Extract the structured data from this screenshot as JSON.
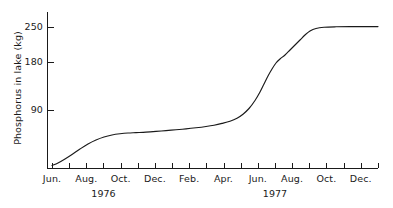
{
  "chart_data": {
    "type": "line",
    "title": "",
    "xlabel": "",
    "ylabel": "Phosphorus in lake (kg)",
    "grid": false,
    "legend": "none",
    "ylim": [
      0,
      268
    ],
    "yticks": [
      90,
      180,
      250
    ],
    "ytick_labels": [
      "90",
      "180",
      "250"
    ],
    "xtick_labels": [
      "Jun.",
      "",
      "Aug.",
      "",
      "Oct.",
      "",
      "Dec.",
      "",
      "Feb.",
      "",
      "Apr.",
      "",
      "Jun.",
      "",
      "Aug.",
      "",
      "Oct.",
      "",
      "Dec.",
      ""
    ],
    "x_group_labels": [
      {
        "label": "1976",
        "center_tick": 3
      },
      {
        "label": "1977",
        "center_tick": 13
      }
    ],
    "x": [
      "Jun. 1976",
      "Jul. 1976",
      "Aug. 1976",
      "Sep. 1976",
      "Oct. 1976",
      "Nov. 1976",
      "Dec. 1976",
      "Jan. 1977",
      "Feb. 1977",
      "Mar. 1977",
      "Apr. 1977",
      "May 1977",
      "Jun. 1977",
      "Jul. 1977",
      "Aug. 1977",
      "Sep. 1977",
      "Oct. 1977",
      "Nov. 1977",
      "Dec. 1977",
      "Jan. 1978"
    ],
    "series": [
      {
        "name": "Phosphorus in lake",
        "values": [
          5,
          14,
          25,
          40,
          49,
          51,
          53,
          55,
          57,
          60,
          63,
          67,
          77,
          110,
          168,
          210,
          238,
          249,
          251,
          251
        ]
      }
    ],
    "curve_points": [
      [
        52,
        165.5
      ],
      [
        58,
        163
      ],
      [
        65,
        159
      ],
      [
        72,
        154.5
      ],
      [
        80,
        149
      ],
      [
        88,
        144
      ],
      [
        96,
        140
      ],
      [
        104,
        137
      ],
      [
        112,
        135
      ],
      [
        120,
        133.8
      ],
      [
        128,
        133
      ],
      [
        136,
        132.6
      ],
      [
        146,
        132.1
      ],
      [
        156,
        131.4
      ],
      [
        166,
        130.6
      ],
      [
        176,
        129.8
      ],
      [
        186,
        128.9
      ],
      [
        196,
        127.8
      ],
      [
        206,
        126.5
      ],
      [
        214,
        125.2
      ],
      [
        222,
        123.4
      ],
      [
        230,
        121.2
      ],
      [
        237,
        118.2
      ],
      [
        243,
        114.2
      ],
      [
        249,
        108.5
      ],
      [
        255,
        100.5
      ],
      [
        260,
        92
      ],
      [
        264,
        84
      ],
      [
        268,
        76
      ],
      [
        272,
        69
      ],
      [
        276,
        63
      ],
      [
        280,
        59
      ],
      [
        285,
        55
      ],
      [
        290,
        50
      ],
      [
        295,
        45
      ],
      [
        300,
        40
      ],
      [
        305,
        35
      ],
      [
        310,
        31
      ],
      [
        316,
        28.5
      ],
      [
        324,
        27.3
      ],
      [
        336,
        26.8
      ],
      [
        350,
        26.6
      ],
      [
        364,
        26.6
      ],
      [
        378,
        26.6
      ]
    ],
    "axis_geometry": {
      "x_axis_y": 168,
      "y_axis_x": 47,
      "y_axis_top": 12,
      "x_axis_right": 378,
      "first_tick_x": 52,
      "tick_spacing": 17.15,
      "y_px_90": 110,
      "y_px_180": 62,
      "y_px_250": 26.6
    }
  }
}
